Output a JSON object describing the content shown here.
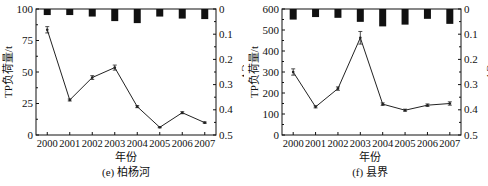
{
  "chart_data": [
    {
      "type": "line",
      "title": "(e) 柏杨河",
      "xlabel": "年份",
      "ylabel": "TP负荷量/t",
      "y2label": "CV",
      "categories": [
        "2000",
        "2001",
        "2002",
        "2003",
        "2004",
        "2005",
        "2006",
        "2007"
      ],
      "ylim": [
        0,
        100
      ],
      "yticks": [
        0,
        25,
        50,
        75,
        100
      ],
      "y2lim": [
        0.5,
        0
      ],
      "y2ticks": [
        0,
        0.1,
        0.2,
        0.3,
        0.4,
        0.5
      ],
      "series": [
        {
          "name": "TP负荷量",
          "type": "line",
          "axis": "left",
          "values": [
            83.5,
            27.8,
            45.6,
            53.5,
            22.5,
            6.1,
            17.7,
            9.8
          ],
          "error": [
            2.5,
            0.8,
            1.5,
            2.0,
            0.8,
            0.4,
            0.8,
            0.5
          ]
        },
        {
          "name": "CV",
          "type": "bar",
          "axis": "right",
          "values": [
            0.024,
            0.024,
            0.03,
            0.048,
            0.056,
            0.03,
            0.038,
            0.04
          ]
        }
      ],
      "grid": false
    },
    {
      "type": "line",
      "title": "(f) 县界",
      "xlabel": "年份",
      "ylabel": "TP负荷量/t",
      "y2label": "CV",
      "categories": [
        "2000",
        "2001",
        "2002",
        "2003",
        "2004",
        "2005",
        "2006",
        "2007"
      ],
      "ylim": [
        0,
        600
      ],
      "yticks": [
        0,
        100,
        200,
        300,
        400,
        500,
        600
      ],
      "y2lim": [
        0.5,
        0
      ],
      "y2ticks": [
        0,
        0.1,
        0.2,
        0.3,
        0.4,
        0.5
      ],
      "series": [
        {
          "name": "TP负荷量",
          "type": "line",
          "axis": "left",
          "values": [
            300,
            134,
            221,
            463,
            147,
            118,
            142,
            150
          ],
          "error": [
            15,
            5,
            8,
            30,
            6,
            5,
            6,
            8
          ]
        },
        {
          "name": "CV",
          "type": "bar",
          "axis": "right",
          "values": [
            0.042,
            0.032,
            0.035,
            0.051,
            0.069,
            0.062,
            0.039,
            0.059
          ]
        }
      ],
      "grid": false
    }
  ]
}
